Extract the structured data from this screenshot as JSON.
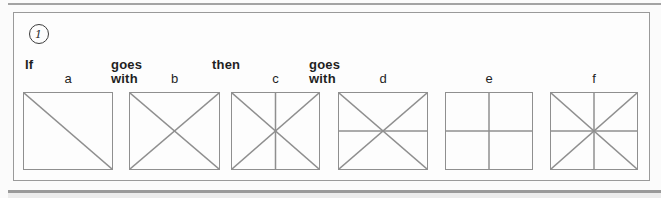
{
  "colors": {
    "line": "#8f8f8f",
    "panel_border": "#9a9a9a",
    "text": "#1f1f1f",
    "rule": "#a3a3a3"
  },
  "question": {
    "number": "1",
    "prompt": {
      "if": "If",
      "goes_with_1": "goes\nwith",
      "then": "then",
      "goes_with_2": "goes\nwith"
    }
  },
  "boxes": [
    {
      "label": "a",
      "pattern": [
        "diagonal-down"
      ]
    },
    {
      "label": "b",
      "pattern": [
        "diagonal-down",
        "diagonal-up"
      ]
    },
    {
      "label": "c",
      "pattern": [
        "diagonal-down",
        "diagonal-up",
        "vertical"
      ]
    },
    {
      "label": "d",
      "pattern": [
        "diagonal-down",
        "diagonal-up",
        "horizontal"
      ]
    },
    {
      "label": "e",
      "pattern": [
        "vertical",
        "horizontal"
      ]
    },
    {
      "label": "f",
      "pattern": [
        "diagonal-down",
        "diagonal-up",
        "vertical",
        "horizontal"
      ]
    }
  ]
}
